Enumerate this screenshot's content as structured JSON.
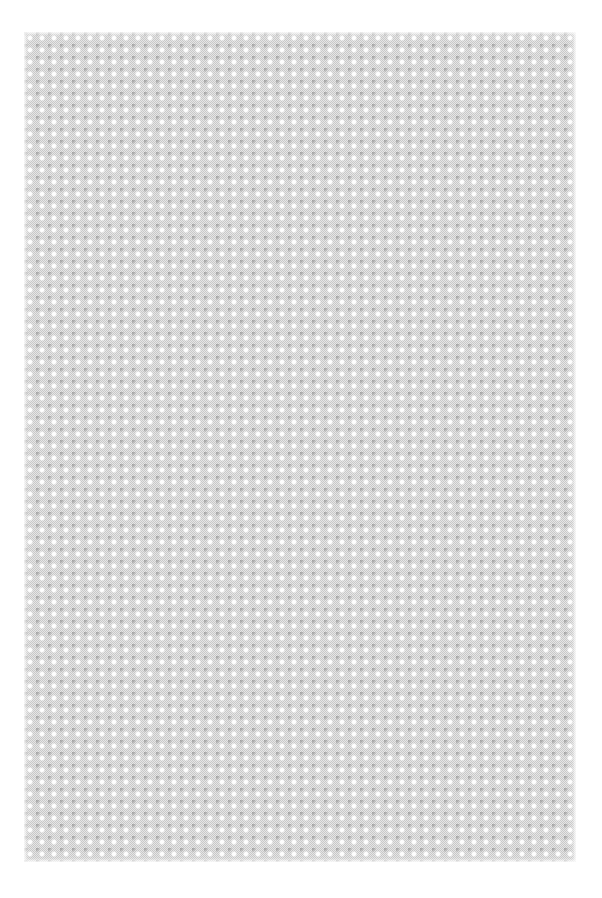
{
  "image": {
    "description": "Gray diamond/checkerboard lattice texture filling the page with white margins",
    "pattern": {
      "type": "diamond-lattice",
      "period_px": 12,
      "base_color": "#c8c8c8",
      "spot_color": "#ffffff",
      "shadow_color": "#969696",
      "margin_color": "#ffffff"
    }
  }
}
